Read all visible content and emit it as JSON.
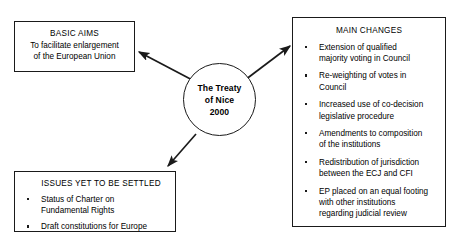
{
  "diagram": {
    "type": "hub-and-spoke concept map",
    "background_color": "#ffffff",
    "line_color": "#1a1a1a",
    "center": {
      "shape": "circle",
      "lines": [
        "The Treaty",
        "of Nice",
        "2000"
      ]
    },
    "nodes": {
      "basic_aims": {
        "title": "BASIC AIMS",
        "lines": [
          "To facilitate enlargement",
          "of the European Union"
        ]
      },
      "issues": {
        "title": "ISSUES YET TO BE SETTLED",
        "bullets": [
          "Status of Charter on\nFundamental Rights",
          "Draft constitutions for Europe"
        ]
      },
      "main_changes": {
        "title": "MAIN CHANGES",
        "bullets": [
          "Extension of qualified\nmajority voting in Council",
          "Re-weighting of votes in\nCouncil",
          "Increased use of co-decision\nlegislative procedure",
          "Amendments to composition\nof the institutions",
          "Redistribution of jurisdiction\nbetween the ECJ and CFI",
          "EP placed on an equal footing\nwith other institutions\nregarding judicial review"
        ]
      }
    },
    "arrows": [
      {
        "name": "arrow-to-basic-aims",
        "from": "center",
        "to": "basic_aims"
      },
      {
        "name": "arrow-to-main-changes",
        "from": "center",
        "to": "main_changes"
      },
      {
        "name": "arrow-to-issues",
        "from": "center",
        "to": "issues"
      }
    ]
  }
}
